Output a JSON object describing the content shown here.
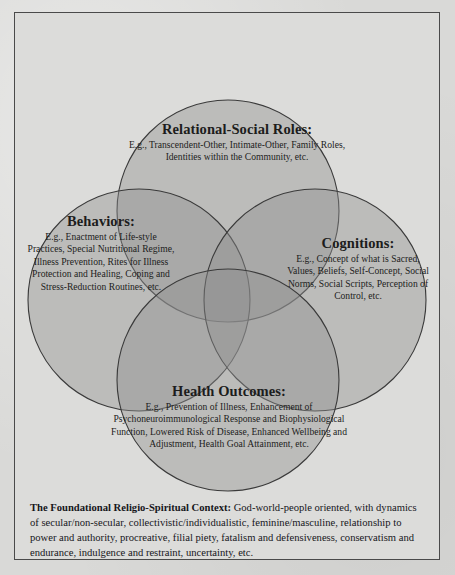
{
  "diagram": {
    "type": "venn-4-circle",
    "background_color": "#d9d9d7",
    "frame_color": "#4a4a4a",
    "circle_stroke_color": "#3a3a3a",
    "circle_fill_color": "#8f8f8f",
    "circle_fill_opacity": 0.42,
    "lobes": [
      {
        "id": "relational-social-roles",
        "position": "top",
        "title": "Relational-Social Roles:",
        "body": "E.g., Transcendent-Other, Intimate-Other, Family Roles, Identities within the Community, etc."
      },
      {
        "id": "behaviors",
        "position": "left",
        "title": "Behaviors:",
        "body": "E.g., Enactment of Life-style Practices, Special Nutritional Regime, Illness Prevention, Rites for Illness Protection and Healing, Coping and Stress-Reduction Routines, etc."
      },
      {
        "id": "cognitions",
        "position": "right",
        "title": "Cognitions:",
        "body": "E.g., Concept of what is Sacred, Values, Beliefs, Self-Concept, Social Norms, Social Scripts, Perception of Control, etc."
      },
      {
        "id": "health-outcomes",
        "position": "bottom",
        "title": "Health Outcomes:",
        "body": "E.g., Prevention of Illness, Enhancement of Psychoneuroimmunological Response and Biophysiological Function, Lowered Risk of Disease, Enhanced Wellbeing and Adjustment, Health Goal Attainment, etc."
      }
    ]
  },
  "caption": {
    "lead": "The Foundational Religio-Spiritual Context:",
    "text": " God-world-people oriented, with dynamics of secular/non-secular, collectivistic/individualistic, feminine/masculine, relationship to power and authority, procreative, filial piety, fatalism and defensiveness, conservatism and endurance, indulgence and restraint, uncertainty, etc."
  }
}
